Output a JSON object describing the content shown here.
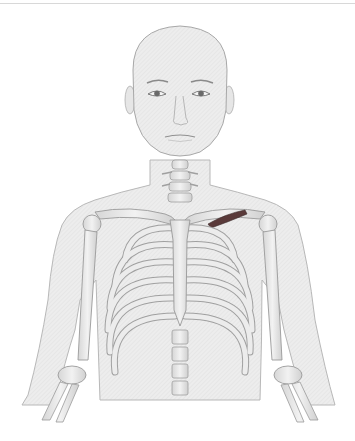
{
  "figure": {
    "highlight": {
      "structure": "muscle beneath right clavicle",
      "color": "#5a3a3a"
    },
    "colors": {
      "background": "#ffffff",
      "skin": "#ececec",
      "skin_outline": "#b5b5b5",
      "bone": "#e4e4e4",
      "bone_outline": "#a0a0a0",
      "cartilage": "#cfcfcf",
      "eyes": "#707070"
    }
  }
}
